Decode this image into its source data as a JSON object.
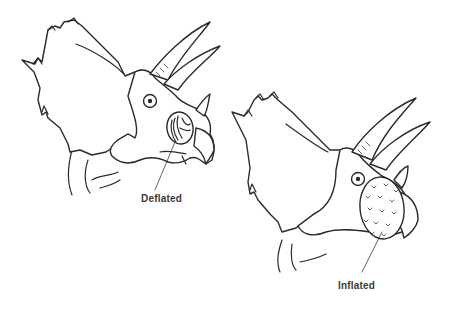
{
  "diagram": {
    "figures": [
      {
        "id": "deflated",
        "label": "Deflated",
        "description": "Triceratops head with deflated nasal sac (folded membrane in nostril)"
      },
      {
        "id": "inflated",
        "label": "Inflated",
        "description": "Triceratops head with inflated, balloon-like nasal sac covered in small scale marks"
      }
    ],
    "colors": {
      "line": "#2a2a2a",
      "background": "#ffffff",
      "label": "#3a3a3a"
    }
  }
}
